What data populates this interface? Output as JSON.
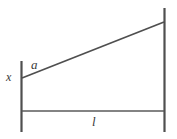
{
  "figure": {
    "background_color": "#ffffff",
    "stroke_color": "#4f4f4f",
    "label_color": "#3a3a3a",
    "width": 177,
    "height": 139
  },
  "labels": {
    "hypotenuse": "a",
    "left_height": "x",
    "base_length": "l"
  },
  "geometry": {
    "left_post": {
      "x": 21.5,
      "y_top": 61,
      "y_bottom": 132,
      "stroke_width": 2.2
    },
    "right_post": {
      "x": 164.5,
      "y_top": 8,
      "y_bottom": 132,
      "stroke_width": 2.2
    },
    "diagonal": {
      "x1": 22,
      "y1": 78,
      "x2": 164,
      "y2": 22,
      "stroke_width": 1.7
    },
    "baseline": {
      "x1": 22,
      "y1": 111,
      "x2": 164,
      "y2": 111,
      "stroke_width": 1.7
    }
  },
  "label_positions": {
    "a": {
      "x": 31,
      "y": 69
    },
    "x": {
      "x": 6,
      "y": 81
    },
    "l": {
      "x": 92,
      "y": 126
    }
  }
}
